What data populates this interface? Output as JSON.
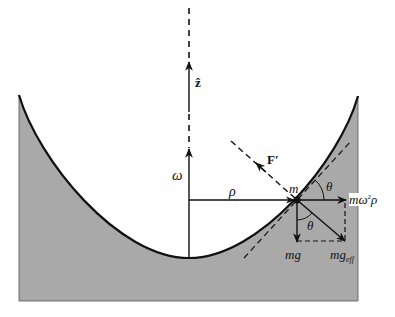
{
  "diagram": {
    "colors": {
      "fluid_fill": "#a9a9a9",
      "line": "#111111",
      "background": "#ffffff"
    },
    "labels": {
      "z_axis": "ẑ",
      "omega": "ω",
      "rho": "ρ",
      "mass": "m",
      "F_prime": "F′",
      "theta_upper": "θ",
      "theta_lower": "θ",
      "centrifugal_m": "m",
      "centrifugal_omega": "ω",
      "centrifugal_sq": "2",
      "centrifugal_rho": "ρ",
      "weight": "mg",
      "effective_weight_main": "mg",
      "effective_weight_sub": "eff"
    },
    "elements": [
      "paraboloid fluid surface (shaded region)",
      "vertical dashed z-axis with unit vector ẑ",
      "angular velocity vector ω along axis",
      "radial distance ρ from axis to mass m",
      "normal force F′ (dashed, perpendicular to surface)",
      "tangent line to surface at m (dashed)",
      "centrifugal force mω²ρ",
      "gravity mg",
      "effective gravity mg_eff",
      "angle θ between tangent and horizontal, and between mg and mg_eff"
    ]
  }
}
